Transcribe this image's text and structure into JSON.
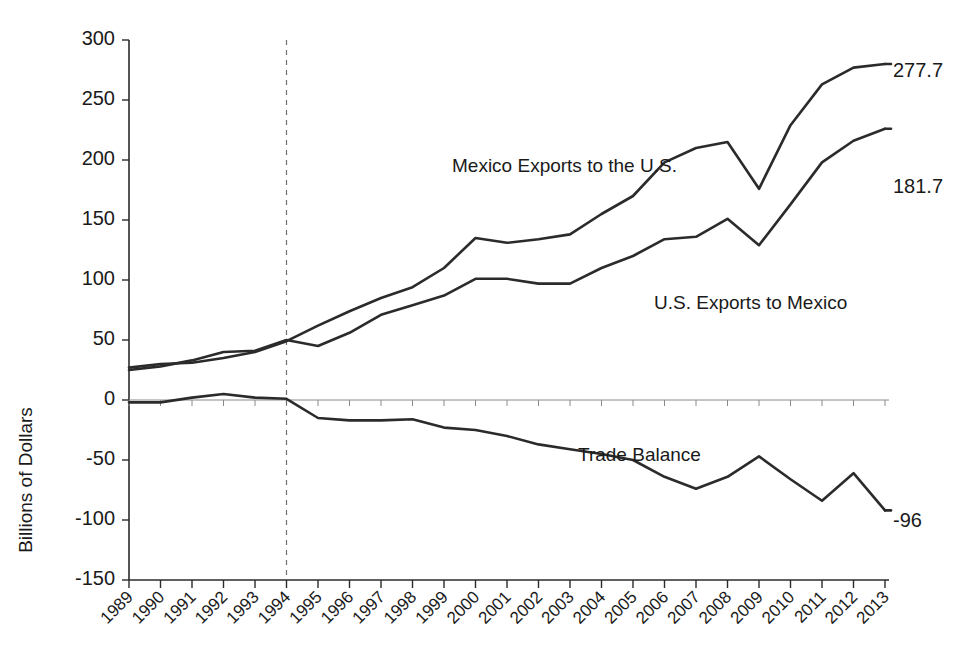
{
  "chart_data": {
    "type": "line",
    "title": "",
    "xlabel": "",
    "ylabel": "Billions of Dollars",
    "ylim": [
      -150,
      300
    ],
    "ytick_values": [
      300,
      250,
      200,
      150,
      100,
      50,
      0,
      -50,
      -100,
      -150
    ],
    "ytick_labels": [
      "300",
      "250",
      "200",
      "150",
      "100",
      "50",
      "0",
      "-50",
      "-100",
      "-150"
    ],
    "grid": false,
    "legend_position": "inline-annotations",
    "categories": [
      "1989",
      "1990",
      "1991",
      "1992",
      "1993",
      "1994",
      "1995",
      "1996",
      "1997",
      "1998",
      "1999",
      "2000",
      "2001",
      "2002",
      "2003",
      "2004",
      "2005",
      "2006",
      "2007",
      "2008",
      "2009",
      "2010",
      "2011",
      "2012",
      "2013"
    ],
    "series": [
      {
        "name": "Mexico Exports to the U.S.",
        "label": "Mexico Exports to the U.S.",
        "end_label": "277.7",
        "values": [
          27,
          30,
          31,
          35,
          40,
          49,
          62,
          74,
          85,
          94,
          110,
          135,
          131,
          134,
          138,
          155,
          170,
          198,
          210,
          215,
          176,
          229,
          263,
          277,
          280
        ]
      },
      {
        "name": "U.S. Exports to Mexico",
        "label": "U.S. Exports to Mexico",
        "end_label": "181.7",
        "values": [
          25,
          28,
          33,
          40,
          41,
          50,
          45,
          56,
          71,
          79,
          87,
          101,
          101,
          97,
          97,
          110,
          120,
          134,
          136,
          151,
          129,
          163,
          198,
          216,
          226
        ]
      },
      {
        "name": "Trade Balance",
        "label": "Trade Balance",
        "end_label": "-96",
        "values": [
          -2,
          -2,
          2,
          5,
          2,
          1,
          -15,
          -17,
          -17,
          -16,
          -23,
          -25,
          -30,
          -37,
          -41,
          -45,
          -50,
          -64,
          -74,
          -64,
          -47,
          -66,
          -84,
          -61,
          -92
        ]
      }
    ],
    "annotations": [
      {
        "name": "nafta-line",
        "type": "vertical-dashed-line",
        "at_category": "1994"
      }
    ]
  },
  "plot_geometry": {
    "x_left": 129,
    "x_right": 885,
    "y_top": 40,
    "y_bottom": 580
  },
  "labels": {
    "mexico_exports_label": "Mexico Exports to the U.S.",
    "us_exports_label": "U.S. Exports to Mexico",
    "trade_balance_label": "Trade Balance",
    "mexico_exports_end": "277.7",
    "us_exports_end": "181.7",
    "trade_balance_end": "-96",
    "y_axis_title": "Billions of Dollars"
  }
}
